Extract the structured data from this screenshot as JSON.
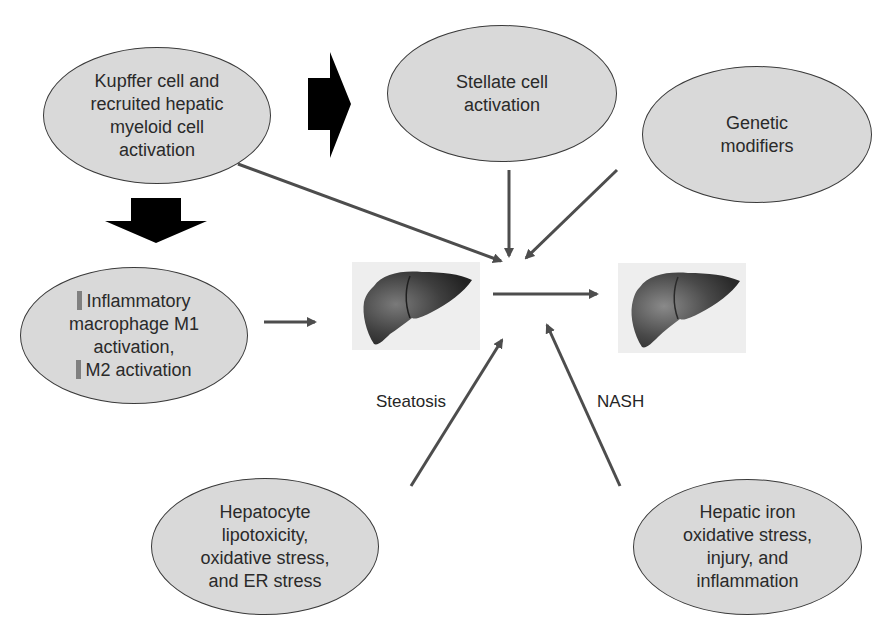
{
  "diagram": {
    "nodes": {
      "kupffer": {
        "lines": [
          "Kupffer cell and",
          "recruited hepatic",
          "myeloid cell",
          "activation"
        ]
      },
      "stellate": {
        "lines": [
          "Stellate cell",
          "activation"
        ]
      },
      "genetic": {
        "lines": [
          "Genetic",
          "modifiers"
        ]
      },
      "macrophage": {
        "lines": [
          "Inflammatory",
          "macrophage M1",
          "activation,",
          "M2 activation"
        ],
        "line1_marker": "up-arrow",
        "line4_marker": "down-arrow"
      },
      "hepatocyte": {
        "lines": [
          "Hepatocyte",
          "lipotoxicity,",
          "oxidative stress,",
          "and ER stress"
        ]
      },
      "iron": {
        "lines": [
          "Hepatic iron",
          "oxidative stress,",
          "injury, and",
          "inflammation"
        ]
      }
    },
    "stages": {
      "steatosis": {
        "label": "Steatosis",
        "image": "liver-steatosis-image"
      },
      "nash": {
        "label": "NASH",
        "image": "liver-nash-image"
      }
    },
    "colors": {
      "node_fill": "#d9d9d9",
      "node_border": "#3a3a3a",
      "arrow": "#4d4d4d",
      "block_arrow": "#000000",
      "liver": "#3c3c3c",
      "liver_bg": "#eeeeee",
      "marker": "#808080"
    },
    "edges": [
      {
        "from": "kupffer",
        "to": "center",
        "type": "thin-arrow"
      },
      {
        "from": "stellate",
        "to": "center",
        "type": "thin-arrow"
      },
      {
        "from": "genetic",
        "to": "center",
        "type": "thin-arrow"
      },
      {
        "from": "macrophage",
        "to": "steatosis",
        "type": "thin-arrow"
      },
      {
        "from": "hepatocyte",
        "to": "center",
        "type": "thin-arrow"
      },
      {
        "from": "iron",
        "to": "center",
        "type": "thin-arrow"
      },
      {
        "from": "steatosis",
        "to": "nash",
        "type": "thin-arrow"
      },
      {
        "from": "kupffer",
        "to": "macrophage",
        "type": "block-arrow-down"
      },
      {
        "from": "kupffer",
        "to": "stellate",
        "type": "block-arrow-right"
      }
    ]
  }
}
